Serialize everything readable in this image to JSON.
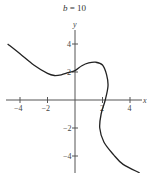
{
  "chart_data": {
    "type": "line",
    "title": "b = 10",
    "title_var": "b",
    "title_value": "= 10",
    "xlabel": "x",
    "ylabel": "y",
    "xlim": [
      -4.8,
      5
    ],
    "ylim": [
      -5,
      5
    ],
    "xticks": [
      -4,
      -2,
      2,
      4
    ],
    "yticks": [
      4,
      2,
      -2,
      -4
    ],
    "xtick_labels": [
      "−4",
      "−2",
      "2",
      "4"
    ],
    "ytick_labels": [
      "4",
      "2",
      "−2",
      "−4"
    ],
    "grid": false,
    "series": [
      {
        "name": "curve",
        "color": "#222222",
        "points": [
          [
            -4.9,
            4.0
          ],
          [
            -4.0,
            3.3
          ],
          [
            -3.0,
            2.5
          ],
          [
            -2.0,
            1.9
          ],
          [
            -1.5,
            1.75
          ],
          [
            -1.0,
            1.8
          ],
          [
            -0.5,
            1.95
          ],
          [
            0.0,
            2.1
          ],
          [
            0.5,
            2.45
          ],
          [
            1.0,
            2.65
          ],
          [
            1.5,
            2.7
          ],
          [
            2.0,
            2.5
          ],
          [
            2.3,
            1.8
          ],
          [
            2.4,
            1.0
          ],
          [
            2.2,
            0.0
          ],
          [
            1.9,
            -1.0
          ],
          [
            1.8,
            -2.0
          ],
          [
            2.1,
            -3.0
          ],
          [
            2.8,
            -3.9
          ],
          [
            3.5,
            -4.6
          ],
          [
            4.7,
            -5.2
          ]
        ]
      }
    ]
  }
}
